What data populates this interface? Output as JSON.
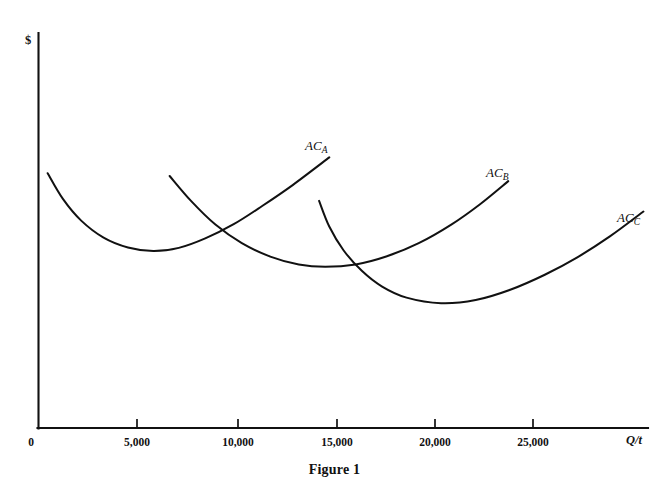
{
  "figure": {
    "caption": "Figure 1",
    "background_color": "#ffffff",
    "line_color": "#111111"
  },
  "chart_data": {
    "type": "line",
    "title": "Figure 1",
    "subtitle": "",
    "xlabel": "Q/t",
    "ylabel": "$",
    "grid": false,
    "legend_position": "inline-curve-labels",
    "xlim": [
      0,
      30000
    ],
    "ylim": [
      0,
      100
    ],
    "x_ticks": [
      0,
      5000,
      10000,
      15000,
      20000,
      25000
    ],
    "x_tick_labels": [
      "0",
      "5,000",
      "10,000",
      "15,000",
      "20,000",
      "25,000"
    ],
    "y_ticks": [],
    "y_tick_labels": [],
    "annotations": [
      {
        "text": "AC_A",
        "x": 13500,
        "y": 73
      },
      {
        "text": "AC_B",
        "x": 22700,
        "y": 65
      },
      {
        "text": "AC_C",
        "x": 29300,
        "y": 54
      }
    ],
    "series": [
      {
        "name": "AC_A",
        "label_main": "AC",
        "label_sub": "A",
        "description": "Short-run average cost curve for plant size A",
        "x_start": 450,
        "x_min": 5650,
        "x_end": 14300,
        "points": [
          {
            "x": 450,
            "y": 64.5
          },
          {
            "x": 1200,
            "y": 58.0
          },
          {
            "x": 2100,
            "y": 52.5
          },
          {
            "x": 3200,
            "y": 48.2
          },
          {
            "x": 4400,
            "y": 45.7
          },
          {
            "x": 5650,
            "y": 44.8
          },
          {
            "x": 6900,
            "y": 45.6
          },
          {
            "x": 8200,
            "y": 48.0
          },
          {
            "x": 9600,
            "y": 51.6
          },
          {
            "x": 11000,
            "y": 56.2
          },
          {
            "x": 12500,
            "y": 61.5
          },
          {
            "x": 14300,
            "y": 68.5
          }
        ]
      },
      {
        "name": "AC_B",
        "label_main": "AC",
        "label_sub": "B",
        "description": "Short-run average cost curve for plant size B",
        "x_start": 6450,
        "x_min": 14100,
        "x_end": 23100,
        "points": [
          {
            "x": 6450,
            "y": 63.8
          },
          {
            "x": 7500,
            "y": 57.5
          },
          {
            "x": 8700,
            "y": 51.5
          },
          {
            "x": 10000,
            "y": 46.8
          },
          {
            "x": 11400,
            "y": 43.4
          },
          {
            "x": 12800,
            "y": 41.4
          },
          {
            "x": 14100,
            "y": 40.8
          },
          {
            "x": 15600,
            "y": 41.4
          },
          {
            "x": 17100,
            "y": 43.4
          },
          {
            "x": 18700,
            "y": 46.8
          },
          {
            "x": 20300,
            "y": 51.5
          },
          {
            "x": 21700,
            "y": 56.6
          },
          {
            "x": 23100,
            "y": 62.5
          }
        ]
      },
      {
        "name": "AC_C",
        "label_main": "AC",
        "label_sub": "C",
        "description": "Short-run average cost curve for plant size C",
        "x_start": 13800,
        "x_min": 19800,
        "x_end": 29750,
        "points": [
          {
            "x": 13800,
            "y": 57.5
          },
          {
            "x": 14300,
            "y": 51.0
          },
          {
            "x": 15000,
            "y": 45.0
          },
          {
            "x": 15900,
            "y": 39.8
          },
          {
            "x": 16900,
            "y": 35.8
          },
          {
            "x": 18100,
            "y": 33.0
          },
          {
            "x": 19800,
            "y": 31.6
          },
          {
            "x": 21500,
            "y": 32.4
          },
          {
            "x": 23200,
            "y": 35.0
          },
          {
            "x": 24900,
            "y": 38.8
          },
          {
            "x": 26500,
            "y": 43.2
          },
          {
            "x": 28100,
            "y": 48.5
          },
          {
            "x": 29750,
            "y": 54.8
          }
        ]
      }
    ]
  }
}
